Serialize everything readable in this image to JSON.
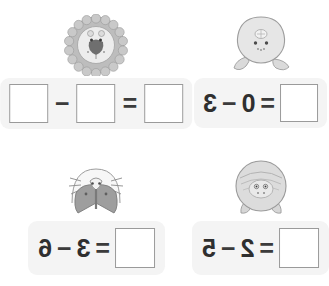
{
  "page": {
    "background_color": "#ffffff",
    "panel_color": "#f4f4f4",
    "box_border_color": "#9a9a9a",
    "text_color": "#2f2f2f",
    "orientation_note": "mirrored"
  },
  "problems": [
    {
      "id": "problem-1",
      "position": "top-left",
      "illustration": "lion-icon",
      "illustration_label": "lion",
      "answer_box": "",
      "equals": "=",
      "minuend_box": "",
      "minus": "−",
      "subtrahend_box": "",
      "all_blank": true
    },
    {
      "id": "problem-2",
      "position": "top-right",
      "illustration": "turtle-icon",
      "illustration_label": "turtle",
      "minuend": "3",
      "minus": "−",
      "subtrahend": "0",
      "equals": "=",
      "answer_box": ""
    },
    {
      "id": "problem-3",
      "position": "bottom-left",
      "illustration": "moth-icon",
      "illustration_label": "moth",
      "minuend": "6",
      "minus": "−",
      "subtrahend": "3",
      "equals": "=",
      "answer_box": ""
    },
    {
      "id": "problem-4",
      "position": "bottom-right",
      "illustration": "pig-icon",
      "illustration_label": "pig",
      "minuend": "5",
      "minus": "−",
      "subtrahend": "2",
      "equals": "=",
      "answer_box": ""
    }
  ]
}
